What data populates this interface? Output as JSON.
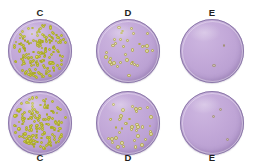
{
  "figure": {
    "type": "petri-dish-colony-panel",
    "rows": 2,
    "columns": 3,
    "background_color": "#ffffff",
    "agar_color": "#c2a8d8",
    "rim_color": "#8a77a8",
    "colony_color_dense": "#d9d93f",
    "colony_color_medium": "#ddd8a8",
    "colony_color_faint": "#c9bfa6"
  },
  "plates": [
    {
      "id": "top-c",
      "label": "C",
      "label_position": "top",
      "row": "top",
      "column": 1,
      "density": "dense",
      "colony_count": 180,
      "colony_size_px": 2.6,
      "seed": 11
    },
    {
      "id": "top-d",
      "label": "D",
      "label_position": "top",
      "row": "top",
      "column": 2,
      "density": "medium",
      "colony_count": 34,
      "colony_size_px": 3.1,
      "seed": 27
    },
    {
      "id": "top-e",
      "label": "E",
      "label_position": "top",
      "row": "top",
      "column": 3,
      "density": "faint",
      "colony_count": 2,
      "colony_size_px": 3.0,
      "seed": 5
    },
    {
      "id": "bottom-c",
      "label": "C",
      "label_position": "bottom",
      "row": "bottom",
      "column": 1,
      "density": "dense",
      "colony_count": 165,
      "colony_size_px": 2.8,
      "seed": 43
    },
    {
      "id": "bottom-d",
      "label": "D",
      "label_position": "bottom",
      "row": "bottom",
      "column": 2,
      "density": "medium",
      "colony_count": 40,
      "colony_size_px": 3.2,
      "seed": 61
    },
    {
      "id": "bottom-e",
      "label": "E",
      "label_position": "bottom",
      "row": "bottom",
      "column": 3,
      "density": "faint",
      "colony_count": 3,
      "colony_size_px": 3.2,
      "seed": 17
    }
  ]
}
